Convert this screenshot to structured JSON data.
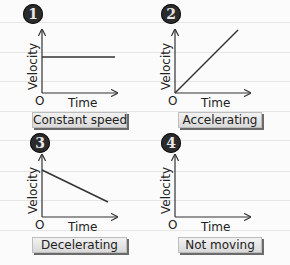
{
  "top_cut_text": "y",
  "axis": {
    "y_label": "Velocity",
    "x_label": "Time",
    "origin": "O"
  },
  "panels": [
    {
      "number": "1",
      "caption": "Constant speed",
      "shape": "horizontal line"
    },
    {
      "number": "2",
      "caption": "Accelerating",
      "shape": "rising line from origin"
    },
    {
      "number": "3",
      "caption": "Decelerating",
      "shape": "falling line"
    },
    {
      "number": "4",
      "caption": "Not moving",
      "shape": "zero velocity"
    }
  ],
  "colors": {
    "badge": "#2b2b2b",
    "line": "#333333",
    "label_bg": "#e4e4e4",
    "ruled_line": "#e6e6e6"
  }
}
